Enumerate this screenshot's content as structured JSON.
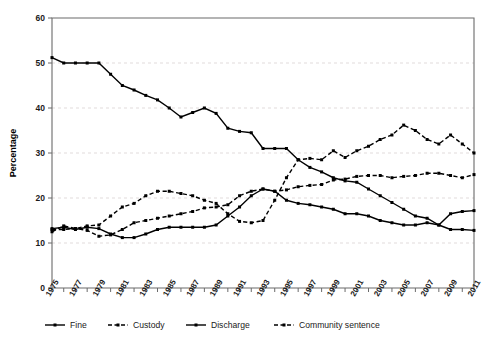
{
  "chart_data": {
    "type": "line",
    "title": "",
    "xlabel": "",
    "ylabel": "Percentage",
    "ylim": [
      0,
      60
    ],
    "yticks": [
      0,
      10,
      20,
      30,
      40,
      50,
      60
    ],
    "grid": true,
    "legend_position": "bottom",
    "x": [
      1975,
      1976,
      1977,
      1978,
      1979,
      1980,
      1981,
      1982,
      1983,
      1984,
      1985,
      1986,
      1987,
      1988,
      1989,
      1990,
      1991,
      1992,
      1993,
      1994,
      1995,
      1996,
      1997,
      1998,
      1999,
      2000,
      2001,
      2002,
      2003,
      2004,
      2005,
      2006,
      2007,
      2008,
      2009,
      2010,
      2011
    ],
    "xtick_labels": [
      "1975",
      "1977",
      "1979",
      "1981",
      "1983",
      "1985",
      "1987",
      "1989",
      "1991",
      "1993",
      "1995",
      "1997",
      "1999",
      "2001",
      "2003",
      "2005",
      "2007",
      "2009",
      "2011"
    ],
    "xtick_values": [
      1975,
      1977,
      1979,
      1981,
      1983,
      1985,
      1987,
      1989,
      1991,
      1993,
      1995,
      1997,
      1999,
      2001,
      2003,
      2005,
      2007,
      2009,
      2011
    ],
    "series": [
      {
        "name": "Fine",
        "style": "solid",
        "values": [
          51.2,
          50.0,
          50.0,
          50.0,
          50.0,
          47.5,
          45.0,
          44.0,
          42.8,
          41.8,
          40.0,
          38.0,
          39.0,
          40.0,
          38.8,
          35.5,
          34.8,
          34.5,
          31.0,
          31.0,
          31.0,
          28.5,
          26.8,
          25.8,
          24.5,
          23.8,
          23.5,
          22.0,
          20.5,
          19.0,
          17.5,
          16.0,
          15.5,
          14.0,
          13.0,
          13.0,
          12.8
        ]
      },
      {
        "name": "Custody",
        "style": "dashed",
        "values": [
          13.0,
          13.0,
          13.2,
          12.8,
          11.5,
          11.8,
          13.0,
          14.5,
          15.0,
          15.5,
          16.0,
          16.5,
          17.0,
          17.8,
          18.0,
          18.5,
          20.5,
          21.5,
          22.0,
          21.5,
          21.8,
          22.5,
          22.8,
          23.0,
          24.0,
          24.2,
          24.8,
          25.0,
          25.0,
          24.5,
          24.8,
          25.0,
          25.5,
          25.5,
          25.0,
          24.5,
          25.2
        ]
      },
      {
        "name": "Discharge",
        "style": "solid",
        "values": [
          13.2,
          13.5,
          13.0,
          13.5,
          13.2,
          12.0,
          11.2,
          11.2,
          12.0,
          13.0,
          13.5,
          13.5,
          13.5,
          13.5,
          14.0,
          16.0,
          18.0,
          20.5,
          22.0,
          21.5,
          19.5,
          18.8,
          18.5,
          18.0,
          17.5,
          16.5,
          16.5,
          16.0,
          15.0,
          14.5,
          14.0,
          14.0,
          14.5,
          14.0,
          16.5,
          17.0,
          17.2
        ]
      },
      {
        "name": "Community sentence",
        "style": "dashed",
        "values": [
          12.5,
          13.8,
          13.2,
          13.8,
          14.0,
          16.0,
          18.0,
          18.8,
          20.5,
          21.5,
          21.5,
          21.0,
          20.5,
          19.5,
          18.8,
          16.5,
          14.8,
          14.5,
          15.0,
          19.5,
          24.5,
          28.5,
          28.8,
          28.5,
          30.5,
          29.0,
          30.5,
          31.5,
          33.0,
          34.0,
          36.2,
          35.0,
          33.0,
          32.0,
          34.0,
          32.0,
          30.0
        ]
      }
    ]
  },
  "legend": {
    "items": [
      {
        "label": "Fine",
        "style": "solid"
      },
      {
        "label": "Custody",
        "style": "dashed"
      },
      {
        "label": "Discharge",
        "style": "solid"
      },
      {
        "label": "Community sentence",
        "style": "dashed"
      }
    ]
  }
}
